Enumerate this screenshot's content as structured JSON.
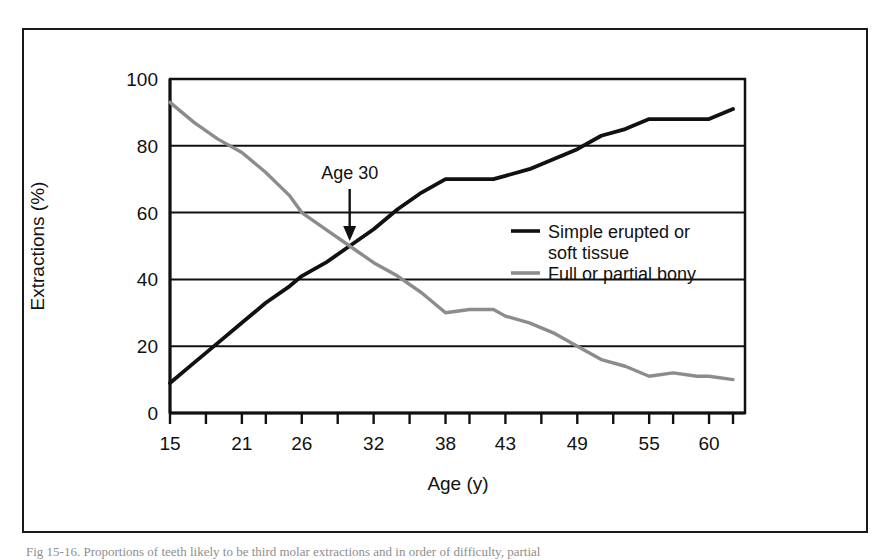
{
  "figure": {
    "caption": "Fig 15-16. Proportions of teeth likely to be third molar extractions and in order of difficulty, partial"
  },
  "chart_data": {
    "type": "line",
    "title": "",
    "xlabel": "Age (y)",
    "ylabel": "Extractions (%)",
    "xlim": [
      15,
      63
    ],
    "ylim": [
      0,
      100
    ],
    "grid": "horizontal",
    "legend_position": "inside-right",
    "y_ticks": [
      0,
      20,
      40,
      60,
      80,
      100
    ],
    "x_tick_labels": [
      "15",
      "21",
      "26",
      "32",
      "38",
      "43",
      "49",
      "55",
      "60"
    ],
    "x_tick_values": [
      15,
      21,
      26,
      32,
      38,
      43,
      49,
      55,
      60
    ],
    "x_minor_tick_values": [
      18,
      23,
      29,
      35,
      40,
      46,
      52,
      57,
      62
    ],
    "annotations": [
      {
        "text": "Age 30",
        "x": 30,
        "y": 50,
        "arrow": "down",
        "note": "crossing point of the two curves at approximately 50%"
      }
    ],
    "series": [
      {
        "name": "Simple erupted or soft tissue",
        "color": "#111111",
        "x": [
          15,
          17,
          19,
          21,
          23,
          25,
          26,
          28,
          30,
          32,
          34,
          36,
          38,
          40,
          42,
          43,
          45,
          47,
          49,
          51,
          53,
          55,
          57,
          59,
          60,
          62
        ],
        "values": [
          9,
          15,
          21,
          27,
          33,
          38,
          41,
          45,
          50,
          55,
          61,
          66,
          70,
          70,
          70,
          71,
          73,
          76,
          79,
          83,
          85,
          88,
          88,
          88,
          88,
          91
        ]
      },
      {
        "name": "Full or partial bony",
        "color": "#8c8c8c",
        "x": [
          15,
          17,
          19,
          21,
          23,
          25,
          26,
          28,
          30,
          32,
          34,
          36,
          38,
          40,
          42,
          43,
          45,
          47,
          49,
          51,
          53,
          55,
          57,
          59,
          60,
          62
        ],
        "values": [
          93,
          87,
          82,
          78,
          72,
          65,
          60,
          55,
          50,
          45,
          41,
          36,
          30,
          31,
          31,
          29,
          27,
          24,
          20,
          16,
          14,
          11,
          12,
          11,
          11,
          10
        ]
      }
    ]
  },
  "legend": {
    "entries": [
      {
        "label_line1": "Simple erupted or",
        "label_line2": "soft tissue",
        "color": "#111111"
      },
      {
        "label_line1": "Full or partial bony",
        "label_line2": "",
        "color": "#8c8c8c"
      }
    ]
  },
  "axes": {
    "y_title": "Extractions (%)",
    "x_title": "Age (y)",
    "y_labels": [
      "100",
      "80",
      "60",
      "40",
      "20",
      "0"
    ],
    "x_labels": [
      "15",
      "21",
      "26",
      "32",
      "38",
      "43",
      "49",
      "55",
      "60"
    ]
  },
  "annotation": {
    "age_label": "Age 30"
  },
  "colors": {
    "series_dark": "#111111",
    "series_gray": "#8c8c8c",
    "axis": "#111111",
    "frame": "#1a1a1a",
    "background": "#ffffff"
  }
}
